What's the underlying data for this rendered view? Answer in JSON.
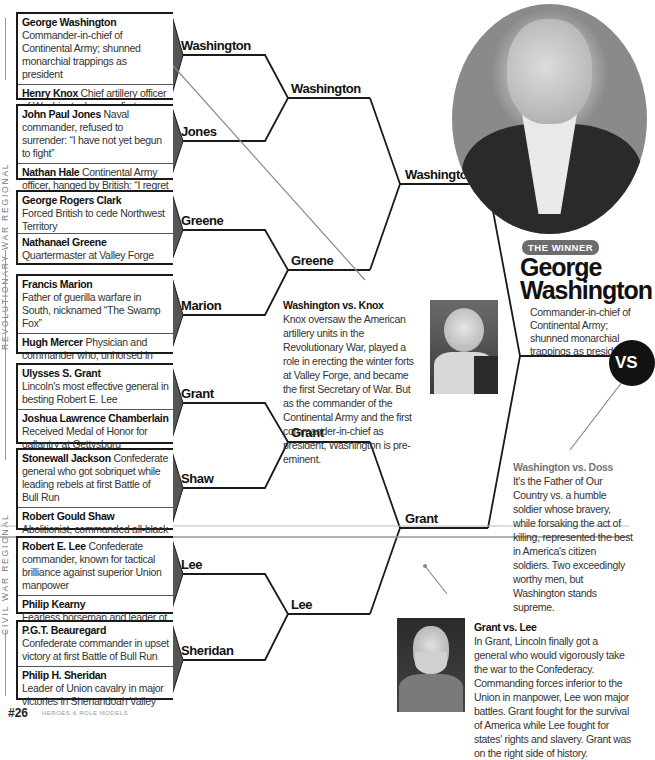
{
  "regions": {
    "revolutionary": "REVOLUTIONARY WAR REGIONAL",
    "civil": "CIVIL WAR REGIONAL"
  },
  "round1": [
    {
      "a": {
        "name": "George Washington",
        "desc": " Commander-in-chief of Continental Army; shunned monarchial trappings as president"
      },
      "b": {
        "name": "Henry Knox",
        "desc": " Chief artillery officer of Washington's army, first secretary of state"
      },
      "winner": "Washington"
    },
    {
      "a": {
        "name": "John Paul Jones",
        "desc": " Naval commander, refused to surrender: “I have not yet begun to fight”"
      },
      "b": {
        "name": "Nathan Hale",
        "desc": " Continental Army officer, hanged by British: “I regret that I have but one life to lose for my country.”"
      },
      "winner": "Jones"
    },
    {
      "a": {
        "name": "George Rogers Clark",
        "desc": "Forced British to cede Northwest Territory"
      },
      "b": {
        "name": "Nathanael Greene",
        "desc": "Quartermaster at Valley Forge"
      },
      "winner": "Greene"
    },
    {
      "a": {
        "name": "Francis Marion",
        "desc": "Father of guerilla warfare in South, nicknamed “The Swamp Fox”"
      },
      "b": {
        "name": "Hugh Mercer",
        "desc": " Physician and commander who, unhorsed in battle, fought with saber unto death"
      },
      "winner": "Marion"
    },
    {
      "a": {
        "name": "Ulysses S. Grant",
        "desc": "Lincoln's most effective general in besting Robert E. Lee"
      },
      "b": {
        "name": "Joshua Lawrence Chamberlain",
        "desc": "Received Medal of Honor for gallantry at Gettysburg"
      },
      "winner": "Grant"
    },
    {
      "a": {
        "name": "Stonewall Jackson",
        "desc": " Confederate general who got sobriquet while leading rebels at first Battle of Bull Run"
      },
      "b": {
        "name": "Robert Gould Shaw",
        "desc": "Abolitionist, commanded all-black 54th Massachusetts Volunteer Infantry"
      },
      "winner": "Shaw"
    },
    {
      "a": {
        "name": "Robert E. Lee",
        "desc": " Confederate commander, known for tactical brilliance against superior Union manpower"
      },
      "b": {
        "name": "Philip Kearny",
        "desc": "Fearless horseman and leader of Union forces in Peninsula campaign"
      },
      "winner": "Lee"
    },
    {
      "a": {
        "name": "P.G.T. Beauregard",
        "desc": "Confederate commander in upset victory at first Battle of Bull Run"
      },
      "b": {
        "name": "Philip H. Sheridan",
        "desc": "Leader of Union cavalry in major victories in Shenandoah Valley"
      },
      "winner": "Sheridan"
    }
  ],
  "round2": [
    "Washington",
    "Greene",
    "Grant",
    "Lee"
  ],
  "round3": [
    "Washington",
    "Grant"
  ],
  "commentary": {
    "washington_knox": {
      "title": "Washington vs. Knox",
      "body": "Knox oversaw the American artillery units in the Revolutionary War, played a role in erecting the winter forts at Valley Forge, and became the first Secretary of War. But as the commander of the Continental Army and the first commander-in-chief as president, Washington is pre-eminent."
    },
    "washington_doss": {
      "title": "Washington vs. Doss",
      "body": "It's the Father of Our Country vs. a humble soldier whose bravery, while forsaking the act of killing, represented the best in America's citizen soldiers. Two exceedingly worthy men, but Washington stands supreme."
    },
    "grant_lee": {
      "title": "Grant vs. Lee",
      "body": "In Grant, Lincoln finally got a general who would vigorously take the war to the Confederacy. Commanding forces inferior to the Union in manpower, Lee won major battles. Grant fought for the survival of America while Lee fought for states' rights and slavery. Grant was on the right side of history."
    }
  },
  "winner": {
    "badge": "THE WINNER",
    "name_line1": "George",
    "name_line2": "Washington",
    "desc": "Commander-in-chief of Continental Army; shunned monarchial trappings as president"
  },
  "vs_label": "VS",
  "footer": {
    "page": "#26",
    "sub": "HEROES & ROLE MODELS"
  }
}
